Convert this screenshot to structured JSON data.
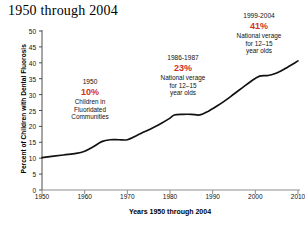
{
  "chart_data": {
    "type": "line",
    "title": "1950 through 2004",
    "xlabel": "Years 1950 through 2004",
    "ylabel": "Percent of Children with Dental Fluorosis",
    "xlim": [
      1950,
      2010
    ],
    "ylim": [
      0,
      50
    ],
    "grid": false,
    "legend": "none",
    "line_color": "#111111",
    "x_ticks": [
      1950,
      1960,
      1970,
      1980,
      1990,
      2000,
      2010
    ],
    "y_ticks": [
      0,
      5,
      10,
      15,
      20,
      25,
      30,
      35,
      40,
      45,
      50
    ],
    "series": [
      {
        "name": "Percent of Children with Dental Fluorosis",
        "x": [
          1950,
          1955,
          1958,
          1960,
          1962,
          1964,
          1966,
          1968,
          1970,
          1972,
          1974,
          1976,
          1978,
          1980,
          1981,
          1983,
          1985,
          1987,
          1989,
          1991,
          1993,
          1995,
          1997,
          1999,
          2001,
          2003,
          2005,
          2007,
          2010
        ],
        "values": [
          10.2,
          11.0,
          11.5,
          12.2,
          13.6,
          15.2,
          15.8,
          15.8,
          15.8,
          17.0,
          18.3,
          19.6,
          21.0,
          22.6,
          23.6,
          23.8,
          23.8,
          23.6,
          24.8,
          26.4,
          28.2,
          30.2,
          32.2,
          34.2,
          35.8,
          36.0,
          36.8,
          38.2,
          40.6
        ]
      }
    ],
    "annotations": [
      {
        "id": "annotation-1950",
        "year": "1950",
        "percent": "10%",
        "percent_color": "#d0311c",
        "lines": [
          "Children in",
          "Fluoridated",
          "Communities"
        ]
      },
      {
        "id": "annotation-1986-1987",
        "year": "1986-1987",
        "percent": "23%",
        "percent_color": "#d0311c",
        "lines": [
          "National verage",
          "for 12–15",
          "year olds"
        ]
      },
      {
        "id": "annotation-1999-2004",
        "year": "1999-2004",
        "percent": "41%",
        "percent_color": "#d0311c",
        "lines": [
          "National verage",
          "for 12–15",
          "year olds"
        ]
      }
    ]
  }
}
